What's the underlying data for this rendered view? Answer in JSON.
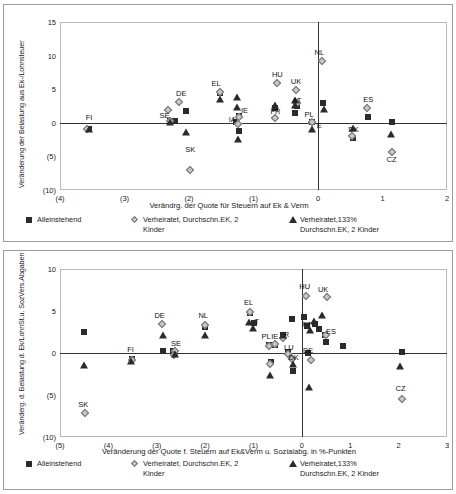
{
  "document": {
    "title": "Veränderung der Steuer- und Abgabenbelastung – Streudiagramme"
  },
  "chart_data": [
    {
      "id": "top",
      "type": "scatter",
      "title": "",
      "xlabel": "Verändrg. der Quote für Steuern auf Ek & Verm",
      "ylabel": "Veränderung der Belastung aus Ek-/Lohnsteuer",
      "xlim": [
        -4,
        2
      ],
      "ylim": [
        -10,
        15
      ],
      "xticks": [
        "(4)",
        "(3)",
        "(2)",
        "(1)",
        "0",
        "1",
        "2"
      ],
      "xtickvals": [
        -4,
        -3,
        -2,
        -1,
        0,
        1,
        2
      ],
      "yticks": [
        "15",
        "10",
        "5",
        "0",
        "(5)",
        "(10)"
      ],
      "ytickvals": [
        15,
        10,
        5,
        0,
        -5,
        -10
      ],
      "grid": false,
      "zero_lines": {
        "x": 0,
        "y": 0
      },
      "legend_position": "bottom",
      "series": [
        {
          "name": "Alleinstehend",
          "marker": "square",
          "points": [
            {
              "label": "FI",
              "x": -3.55,
              "y": -0.9
            },
            {
              "label": "SE",
              "x": -2.3,
              "y": 0.25
            },
            {
              "label": "",
              "x": -2.22,
              "y": 0.2
            },
            {
              "label": "",
              "x": -2.05,
              "y": 1.8
            },
            {
              "label": "EL",
              "x": -1.52,
              "y": 4.5
            },
            {
              "label": "IE",
              "x": -1.22,
              "y": 1.0
            },
            {
              "label": "IA",
              "x": -1.27,
              "y": 0.1
            },
            {
              "label": "",
              "x": -1.22,
              "y": -1.2
            },
            {
              "label": "FR",
              "x": -0.66,
              "y": 2.2
            },
            {
              "label": "AT",
              "x": -0.36,
              "y": 1.4
            },
            {
              "label": "",
              "x": -0.33,
              "y": 2.5
            },
            {
              "label": "PL",
              "x": -0.1,
              "y": 0.15
            },
            {
              "label": "",
              "x": 0.08,
              "y": 2.9
            },
            {
              "label": "DK",
              "x": 0.55,
              "y": -2.3
            },
            {
              "label": "ES",
              "x": 0.78,
              "y": 0.8
            },
            {
              "label": "",
              "x": 1.14,
              "y": 0.1
            }
          ]
        },
        {
          "name": "Verheiratet, Durchschn.EK, 2 Kinder",
          "marker": "diamond",
          "points": [
            {
              "label": "FI",
              "x": -3.58,
              "y": -0.85
            },
            {
              "label": "SE",
              "x": -2.33,
              "y": 1.9
            },
            {
              "label": "",
              "x": -2.3,
              "y": 0.2
            },
            {
              "label": "DE",
              "x": -2.16,
              "y": 3.1
            },
            {
              "label": "EL",
              "x": -1.52,
              "y": 4.6
            },
            {
              "label": "IE",
              "x": -1.22,
              "y": 0.9
            },
            {
              "label": "",
              "x": -1.24,
              "y": -0.2
            },
            {
              "label": "HU",
              "x": -0.63,
              "y": 5.9
            },
            {
              "label": "FR",
              "x": -0.66,
              "y": 0.7
            },
            {
              "label": "UK",
              "x": -0.34,
              "y": 4.9
            },
            {
              "label": "",
              "x": -0.33,
              "y": 3.0
            },
            {
              "label": "",
              "x": -0.1,
              "y": 0.1
            },
            {
              "label": "NL",
              "x": 0.06,
              "y": 9.2
            },
            {
              "label": "",
              "x": 0.52,
              "y": -1.9
            },
            {
              "label": "ES",
              "x": 0.76,
              "y": 2.2
            },
            {
              "label": "CZ",
              "x": 1.14,
              "y": -4.4
            }
          ]
        },
        {
          "name": "Verheiratet,133% Durchschn.EK, 2 Kinder",
          "marker": "triangle",
          "points": [
            {
              "label": "FI",
              "x": -3.55,
              "y": -0.95
            },
            {
              "label": "",
              "x": -2.3,
              "y": 0.1
            },
            {
              "label": "",
              "x": -2.05,
              "y": -1.3
            },
            {
              "label": "EL",
              "x": -1.52,
              "y": 3.6
            },
            {
              "label": "",
              "x": -1.26,
              "y": 3.9
            },
            {
              "label": "",
              "x": -1.25,
              "y": 2.4
            },
            {
              "label": "",
              "x": -1.24,
              "y": -2.4
            },
            {
              "label": "",
              "x": -0.66,
              "y": 2.6
            },
            {
              "label": "AT",
              "x": -0.35,
              "y": 3.4
            },
            {
              "label": "",
              "x": -0.36,
              "y": 2.6
            },
            {
              "label": "",
              "x": -0.09,
              "y": -0.9
            },
            {
              "label": "",
              "x": 0.09,
              "y": 2.1
            },
            {
              "label": "",
              "x": 0.55,
              "y": -0.7
            },
            {
              "label": "CZ",
              "x": 1.13,
              "y": -1.6
            }
          ]
        }
      ],
      "point_labels": [
        {
          "text": "FI",
          "x": -3.55,
          "y": 0.65
        },
        {
          "text": "SE",
          "x": -2.38,
          "y": 1.05
        },
        {
          "text": "DE",
          "x": -2.12,
          "y": 4.25
        },
        {
          "text": "SK",
          "x": -1.98,
          "y": -4.0
        },
        {
          "text": "EL",
          "x": -1.58,
          "y": 5.7
        },
        {
          "text": "IE",
          "x": -1.14,
          "y": 1.7
        },
        {
          "text": "IA",
          "x": -1.33,
          "y": 0.35
        },
        {
          "text": "HU",
          "x": -0.63,
          "y": 7.1
        },
        {
          "text": "FR",
          "x": -0.66,
          "y": 1.55
        },
        {
          "text": "UK",
          "x": -0.34,
          "y": 6.1
        },
        {
          "text": "AT",
          "x": -0.33,
          "y": 3.2
        },
        {
          "text": "PL",
          "x": -0.14,
          "y": 1.1
        },
        {
          "text": "NL",
          "x": 0.02,
          "y": 10.4
        },
        {
          "text": "E",
          "x": 0.02,
          "y": -0.45
        },
        {
          "text": "DK",
          "x": 0.55,
          "y": -1.05
        },
        {
          "text": "ES",
          "x": 0.78,
          "y": 3.4
        },
        {
          "text": "CZ",
          "x": 1.14,
          "y": -5.6
        }
      ],
      "extra_markers": [
        {
          "marker": "diamond",
          "x": -1.98,
          "y": -7.0,
          "label": "SK"
        }
      ],
      "legend": [
        {
          "symbol": "square",
          "label": "Alleinstehend"
        },
        {
          "symbol": "diamond",
          "label": "Verheiratet, Durchschn.EK, 2",
          "label2": "Kinder"
        },
        {
          "symbol": "triangle",
          "label": "Verheiratet,133%",
          "label2": "Durchschn.EK, 2 Kinder"
        }
      ]
    },
    {
      "id": "bottom",
      "type": "scatter",
      "title": "",
      "xlabel": "Veränderung der Quote f. Steuern auf Ek&Verm u. Sozialabg. in %-Punkten",
      "ylabel": "Veränderg. d. Belastung d. Ek/LohnSt.u. SozVers.Abgaben",
      "xlim": [
        -5,
        3
      ],
      "ylim": [
        -10,
        10
      ],
      "xticks": [
        "(5)",
        "(4)",
        "(3)",
        "(2)",
        "(1)",
        "0",
        "1",
        "2",
        "3"
      ],
      "xtickvals": [
        -5,
        -4,
        -3,
        -2,
        -1,
        0,
        1,
        2,
        3
      ],
      "yticks": [
        "10",
        "5",
        "0",
        "(5)",
        "(10)"
      ],
      "ytickvals": [
        10,
        5,
        0,
        -5,
        -10
      ],
      "grid": false,
      "zero_lines": {
        "x": 0,
        "y": 0
      },
      "legend_position": "bottom",
      "series": [
        {
          "name": "Alleinstehend",
          "marker": "square",
          "points": [
            {
              "label": "",
              "x": -4.5,
              "y": 2.5
            },
            {
              "label": "FI",
              "x": -3.52,
              "y": -0.75
            },
            {
              "label": "",
              "x": -2.87,
              "y": 0.2
            },
            {
              "label": "SE",
              "x": -2.67,
              "y": 0.2
            },
            {
              "label": "NL",
              "x": -2.0,
              "y": 3.1
            },
            {
              "label": "EL",
              "x": -1.08,
              "y": 4.8
            },
            {
              "label": "AT",
              "x": -1.0,
              "y": 3.6
            },
            {
              "label": "PL",
              "x": -0.68,
              "y": 1.0
            },
            {
              "label": "IE",
              "x": -0.55,
              "y": 1.0
            },
            {
              "label": "",
              "x": -0.64,
              "y": -1.1
            },
            {
              "label": "FR",
              "x": -0.38,
              "y": 2.1
            },
            {
              "label": "",
              "x": -0.2,
              "y": 4.1
            },
            {
              "label": "LU",
              "x": -0.28,
              "y": 0.1
            },
            {
              "label": "DK",
              "x": -0.18,
              "y": -2.2
            },
            {
              "label": "",
              "x": 0.05,
              "y": 4.3
            },
            {
              "label": "PT",
              "x": 0.1,
              "y": 3.2
            },
            {
              "label": "DE",
              "x": 0.12,
              "y": 0.0
            },
            {
              "label": "",
              "x": 0.28,
              "y": 3.5
            },
            {
              "label": "",
              "x": 0.35,
              "y": 2.8
            },
            {
              "label": "ES",
              "x": 0.48,
              "y": 2.2
            },
            {
              "label": "",
              "x": 0.5,
              "y": 1.3
            },
            {
              "label": "",
              "x": 0.86,
              "y": 0.8
            },
            {
              "label": "",
              "x": 2.06,
              "y": 0.1
            }
          ]
        },
        {
          "name": "Verheiratet, Durchschn.EK, 2 Kinder",
          "marker": "diamond",
          "points": [
            {
              "label": "SK",
              "x": -4.48,
              "y": -7.2
            },
            {
              "label": "FI",
              "x": -3.52,
              "y": -0.8
            },
            {
              "label": "DE",
              "x": -2.9,
              "y": 3.4
            },
            {
              "label": "SE",
              "x": -2.62,
              "y": 0.2
            },
            {
              "label": "",
              "x": -2.65,
              "y": -0.2
            },
            {
              "label": "NL",
              "x": -2.0,
              "y": 3.3
            },
            {
              "label": "EL",
              "x": -1.08,
              "y": 4.9
            },
            {
              "label": "",
              "x": -0.68,
              "y": 0.8
            },
            {
              "label": "IE",
              "x": -0.55,
              "y": 1.1
            },
            {
              "label": "",
              "x": -0.66,
              "y": -1.3
            },
            {
              "label": "FR",
              "x": -0.38,
              "y": 1.8
            },
            {
              "label": "LU",
              "x": -0.28,
              "y": -0.1
            },
            {
              "label": "DK",
              "x": -0.2,
              "y": -0.7
            },
            {
              "label": "HU",
              "x": 0.08,
              "y": 6.8
            },
            {
              "label": "UK",
              "x": 0.52,
              "y": 6.7
            },
            {
              "label": "DE",
              "x": 0.18,
              "y": -0.8
            },
            {
              "label": "ES",
              "x": 0.5,
              "y": 2.2
            },
            {
              "label": "CZ",
              "x": 2.06,
              "y": -5.5
            }
          ]
        },
        {
          "name": "Verheiratet,133% Durchschn.EK, 2 Kinder",
          "marker": "triangle",
          "points": [
            {
              "label": "",
              "x": -4.5,
              "y": -1.4
            },
            {
              "label": "FI",
              "x": -3.53,
              "y": -0.9
            },
            {
              "label": "DE",
              "x": -2.88,
              "y": 2.2
            },
            {
              "label": "",
              "x": -2.62,
              "y": -0.1
            },
            {
              "label": "NL",
              "x": -2.0,
              "y": 2.1
            },
            {
              "label": "",
              "x": -1.1,
              "y": 3.7
            },
            {
              "label": "AT",
              "x": -1.02,
              "y": 3.0
            },
            {
              "label": "",
              "x": -0.66,
              "y": -2.6
            },
            {
              "label": "",
              "x": -0.38,
              "y": 2.2
            },
            {
              "label": "",
              "x": -0.18,
              "y": -1.3
            },
            {
              "label": "",
              "x": 0.16,
              "y": 2.7
            },
            {
              "label": "",
              "x": 0.14,
              "y": -4.0
            },
            {
              "label": "",
              "x": 0.26,
              "y": 3.8
            },
            {
              "label": "",
              "x": 0.42,
              "y": 4.5
            },
            {
              "label": "CZ",
              "x": 2.02,
              "y": -1.6
            }
          ]
        }
      ],
      "point_labels": [
        {
          "text": "SK",
          "x": -4.52,
          "y": -6.2
        },
        {
          "text": "FI",
          "x": -3.54,
          "y": 0.35
        },
        {
          "text": "DE",
          "x": -2.94,
          "y": 4.4
        },
        {
          "text": "SE",
          "x": -2.6,
          "y": 1.1
        },
        {
          "text": "NL",
          "x": -2.04,
          "y": 4.4
        },
        {
          "text": "EL",
          "x": -1.1,
          "y": 6.0
        },
        {
          "text": "T",
          "x": -0.93,
          "y": 3.7
        },
        {
          "text": "PL",
          "x": -0.74,
          "y": 1.9
        },
        {
          "text": "IE",
          "x": -0.56,
          "y": 1.9
        },
        {
          "text": "R",
          "x": -0.32,
          "y": 2.2
        },
        {
          "text": "LU",
          "x": -0.27,
          "y": 0.6
        },
        {
          "text": "DK",
          "x": -0.17,
          "y": -0.6
        },
        {
          "text": "HU",
          "x": 0.06,
          "y": 7.8
        },
        {
          "text": "UK",
          "x": 0.44,
          "y": 7.5
        },
        {
          "text": "PT",
          "x": 0.1,
          "y": 3.3
        },
        {
          "text": "DE",
          "x": 0.13,
          "y": 0.2
        },
        {
          "text": "ES",
          "x": 0.6,
          "y": 2.5
        },
        {
          "text": "CZ",
          "x": 2.04,
          "y": -4.3
        }
      ],
      "extra_markers": [],
      "legend": [
        {
          "symbol": "square",
          "label": "Alleinstehend"
        },
        {
          "symbol": "diamond",
          "label": "Verheiratet, Durchschn.EK, 2",
          "label2": "Kinder"
        },
        {
          "symbol": "triangle",
          "label": "Verheiratet,133%",
          "label2": "Durchschn.EK, 2 Kinder"
        }
      ]
    }
  ]
}
